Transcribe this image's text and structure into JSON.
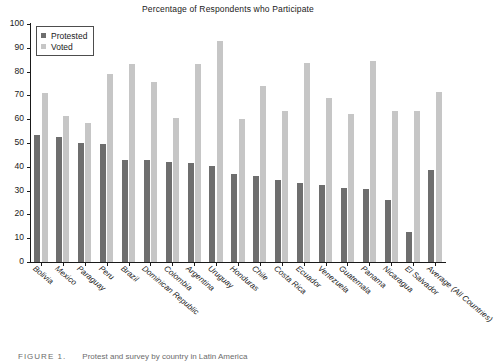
{
  "chart_data": {
    "type": "bar",
    "title": "Percentage of Respondents who Participate",
    "xlabel": "",
    "ylabel": "",
    "ylim": [
      0,
      100
    ],
    "yticks": [
      0,
      10,
      20,
      30,
      40,
      50,
      60,
      70,
      80,
      90,
      100
    ],
    "grid": false,
    "legend_position": "top-left",
    "categories": [
      "Bolivia",
      "Mexico",
      "Paraguay",
      "Peru",
      "Brazil",
      "Dominican Republic",
      "Colombia",
      "Argentina",
      "Uruguay",
      "Honduras",
      "Chile",
      "Costa Rica",
      "Ecuador",
      "Venezuela",
      "Guatemala",
      "Panama",
      "Nicaragua",
      "El Salvador",
      "Average (All Countries)"
    ],
    "series": [
      {
        "name": "Protested",
        "color": "#6e6e6e",
        "values": [
          53.5,
          52.5,
          50,
          49.5,
          43,
          43,
          42,
          41.5,
          40.5,
          37,
          36,
          34.5,
          33,
          32.5,
          31,
          30.5,
          26,
          12.5,
          38.5
        ]
      },
      {
        "name": "Voted",
        "color": "#c6c6c6",
        "values": [
          71,
          61.5,
          58.5,
          79,
          83,
          75.5,
          60.5,
          83,
          93,
          60,
          74,
          63.5,
          83.5,
          69,
          62,
          84.5,
          63.5,
          63.5,
          71.5
        ]
      }
    ]
  },
  "caption": {
    "label": "FIGURE 1.",
    "text": "Protest and survey by country in Latin America"
  }
}
